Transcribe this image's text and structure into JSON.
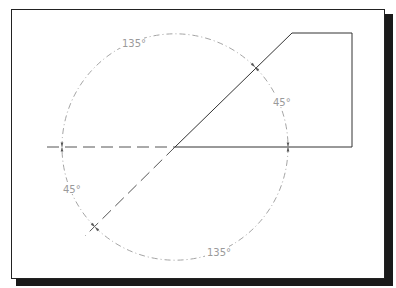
{
  "drawing": {
    "labels": {
      "top_angle": "135°",
      "right_angle": "45°",
      "left_angle": "45°",
      "bottom_angle": "135°"
    },
    "colors": {
      "object_line": "#333333",
      "dimension_line": "#9a9a9a",
      "frame": "#222222",
      "shadow": "#1a1a1a"
    }
  }
}
